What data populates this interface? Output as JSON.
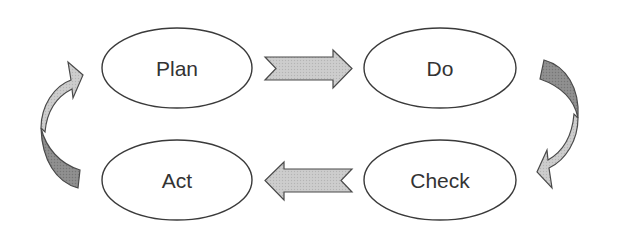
{
  "diagram": {
    "nodes": [
      {
        "id": "plan",
        "label": "Plan"
      },
      {
        "id": "do",
        "label": "Do"
      },
      {
        "id": "check",
        "label": "Check"
      },
      {
        "id": "act",
        "label": "Act"
      }
    ],
    "edges": [
      {
        "from": "plan",
        "to": "do",
        "style": "straight-arrow-right"
      },
      {
        "from": "do",
        "to": "check",
        "style": "curved-arrow-down"
      },
      {
        "from": "check",
        "to": "act",
        "style": "straight-arrow-left"
      },
      {
        "from": "act",
        "to": "plan",
        "style": "curved-arrow-up"
      }
    ],
    "colors": {
      "ellipse_stroke": "#3a3a3a",
      "ellipse_fill": "#ffffff",
      "text": "#333333",
      "arrow_light": "#c6c6c6",
      "arrow_dark": "#8a8a8a",
      "arrow_stroke": "#4a4a4a"
    }
  }
}
